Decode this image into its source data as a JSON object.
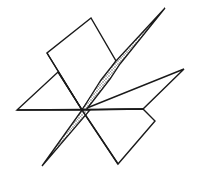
{
  "diagram": {
    "stroke_color": "#1a1a1a",
    "fill_color": "#ffffff",
    "shade_color": "#9a9a9a",
    "center": [
      82,
      110
    ],
    "shapes": [
      {
        "name": "top-quad",
        "points": "82,110 47,53 91,18 116,61"
      },
      {
        "name": "left-triangle",
        "points": "82,110 17,110 58,72"
      },
      {
        "name": "right-triangle",
        "points": "82,110 184,69 143,109"
      },
      {
        "name": "bottom-right-pentagon",
        "points": "82,110 143,109 155,121 118,164"
      },
      {
        "name": "shaded-sliver",
        "points": "165,8 116,61 101,80 82,110 42,166 92,110 110,79 120,64"
      }
    ]
  }
}
